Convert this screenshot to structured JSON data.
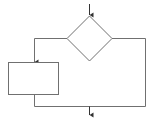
{
  "diagram": {
    "type": "flowchart",
    "stroke_color": "#707070",
    "fill_color": "#ffffff",
    "nodes": [
      {
        "id": "decision",
        "shape": "diamond",
        "label": ""
      },
      {
        "id": "process",
        "shape": "rectangle",
        "label": ""
      }
    ],
    "edges": [
      {
        "from": "entry",
        "to": "decision"
      },
      {
        "from": "decision",
        "to": "process",
        "side": "left"
      },
      {
        "from": "decision",
        "to": "merge",
        "side": "right"
      },
      {
        "from": "process",
        "to": "merge"
      },
      {
        "from": "merge",
        "to": "exit"
      }
    ]
  }
}
